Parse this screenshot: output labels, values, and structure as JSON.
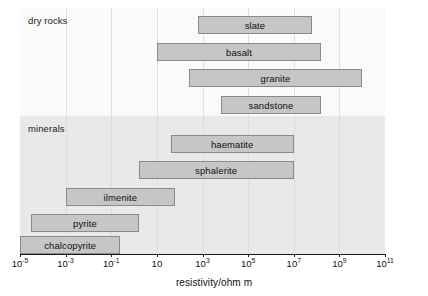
{
  "chart_data": {
    "type": "bar",
    "orientation": "horizontal",
    "title": "",
    "xlabel": "resistivity/ohm m",
    "ylabel": "",
    "xscale": "log",
    "xlim": [
      1e-05,
      100000000000.0
    ],
    "xlim_exponents": [
      -5,
      11
    ],
    "grid": true,
    "legend": false,
    "xticks": [
      {
        "label": "10",
        "exponent": "-5",
        "value_exp": -5
      },
      {
        "label": "10",
        "exponent": "-3",
        "value_exp": -3
      },
      {
        "label": "10",
        "exponent": "-1",
        "value_exp": -1
      },
      {
        "label": "10",
        "exponent": "",
        "value_exp": 1
      },
      {
        "label": "10",
        "exponent": "3",
        "value_exp": 3
      },
      {
        "label": "10",
        "exponent": "5",
        "value_exp": 5
      },
      {
        "label": "10",
        "exponent": "7",
        "value_exp": 7
      },
      {
        "label": "10",
        "exponent": "9",
        "value_exp": 9
      },
      {
        "label": "10",
        "exponent": "11",
        "value_exp": 11
      }
    ],
    "gridline_exponents": [
      -3,
      -1,
      1,
      3,
      5,
      7,
      9
    ],
    "groups": [
      {
        "name": "dry rocks",
        "label": "dry rocks",
        "background": "#fafafa",
        "bars": [
          {
            "label": "slate",
            "start_exp": 2.8,
            "end_exp": 7.8,
            "start": 630.0,
            "end": 63000000.0
          },
          {
            "label": "basalt",
            "start_exp": 1.0,
            "end_exp": 8.2,
            "start": 10.0,
            "end": 160000000.0
          },
          {
            "label": "granite",
            "start_exp": 2.4,
            "end_exp": 10.0,
            "start": 250.0,
            "end": 10000000000.0
          },
          {
            "label": "sandstone",
            "start_exp": 3.8,
            "end_exp": 8.2,
            "start": 6300.0,
            "end": 160000000.0
          }
        ]
      },
      {
        "name": "minerals",
        "label": "minerals",
        "background": "#e9e9e9",
        "bars": [
          {
            "label": "haematite",
            "start_exp": 1.6,
            "end_exp": 7.0,
            "start": 40.0,
            "end": 10000000.0
          },
          {
            "label": "sphalerite",
            "start_exp": 0.2,
            "end_exp": 7.0,
            "start": 1.6,
            "end": 10000000.0
          },
          {
            "label": "ilmenite",
            "start_exp": -3.0,
            "end_exp": 1.8,
            "start": 0.001,
            "end": 63.0
          },
          {
            "label": "pyrite",
            "start_exp": -4.5,
            "end_exp": 0.2,
            "start": 3.2e-05,
            "end": 1.6
          },
          {
            "label": "chalcopyrite",
            "start_exp": -5.0,
            "end_exp": -0.6,
            "start": 1e-05,
            "end": 0.25
          }
        ]
      }
    ],
    "colors": {
      "bar_fill": "#c6c6c6",
      "bar_border": "#8a8a8a",
      "dry_rocks_band": "#fafafa",
      "minerals_band": "#e9e9e9",
      "gridline": "#e0e0e0",
      "axis": "#1a1a1a",
      "text": "#111111"
    }
  }
}
